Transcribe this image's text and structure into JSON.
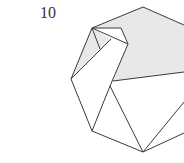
{
  "step": {
    "number": "10"
  },
  "colors": {
    "line": "#3a3a3a",
    "shade": "#e8e8e8",
    "paper": "#ffffff"
  }
}
